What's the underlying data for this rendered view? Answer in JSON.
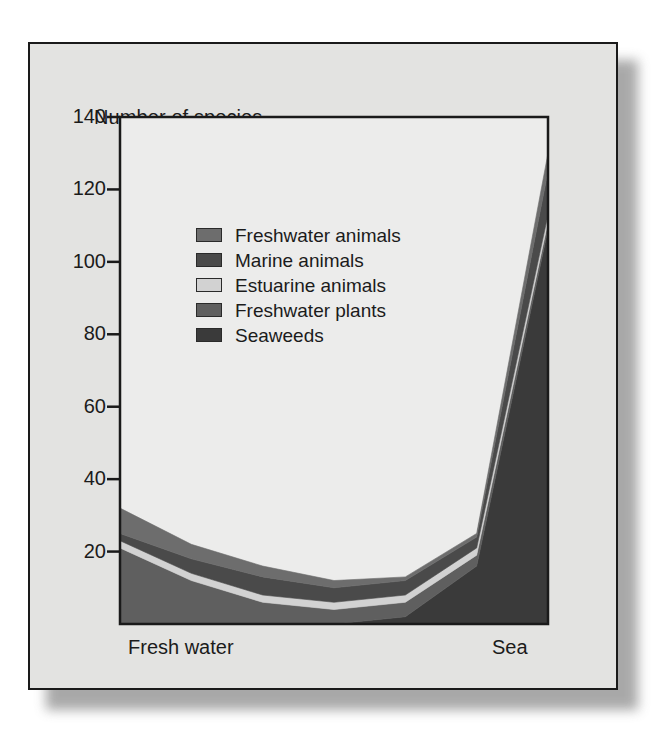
{
  "figure": {
    "axis_title": "Number of species",
    "x_label_left": "Fresh water",
    "x_label_right": "Sea",
    "background_color": "#e3e3e1",
    "plot_background_color": "#ececeb",
    "frame_color": "#1a1a1a"
  },
  "legend": {
    "items": [
      {
        "label": "Freshwater animals",
        "color": "#6d6d6d"
      },
      {
        "label": "Marine animals",
        "color": "#4a4a4a"
      },
      {
        "label": "Estuarine animals",
        "color": "#d2d2d2"
      },
      {
        "label": "Freshwater plants",
        "color": "#5f5f5f"
      },
      {
        "label": "Seaweeds",
        "color": "#3a3a3a"
      }
    ]
  },
  "chart_data": {
    "type": "area",
    "title": "Number of species",
    "subtitle": "",
    "xlabel": "",
    "ylabel": "Number of species",
    "xlim": [
      0,
      6
    ],
    "ylim": [
      0,
      140
    ],
    "yticks": [
      20,
      40,
      60,
      80,
      100,
      120,
      140
    ],
    "ytick_labels": [
      "20",
      "40",
      "60",
      "80",
      "100",
      "120",
      "140"
    ],
    "xtick_labels": [
      "Fresh water",
      "Sea"
    ],
    "grid": false,
    "legend_position": "upper-left-inside",
    "stacked": true,
    "x": [
      0,
      1,
      2,
      3,
      4,
      5,
      6
    ],
    "series": [
      {
        "name": "Seaweeds",
        "color": "#3a3a3a",
        "values": [
          0,
          0,
          0,
          0,
          2,
          16,
          109
        ]
      },
      {
        "name": "Freshwater plants",
        "color": "#5f5f5f",
        "values": [
          21,
          12,
          6,
          4,
          4,
          3,
          2
        ]
      },
      {
        "name": "Estuarine animals",
        "color": "#d2d2d2",
        "values": [
          2,
          2,
          2,
          2,
          2,
          2,
          2
        ]
      },
      {
        "name": "Marine animals",
        "color": "#4a4a4a",
        "values": [
          2,
          4,
          5,
          4,
          4,
          3,
          12
        ]
      },
      {
        "name": "Freshwater animals",
        "color": "#6d6d6d",
        "values": [
          7,
          4,
          3,
          2,
          1,
          1,
          5
        ]
      }
    ],
    "stack_totals": [
      32,
      22,
      16,
      12,
      13,
      25,
      130
    ]
  }
}
